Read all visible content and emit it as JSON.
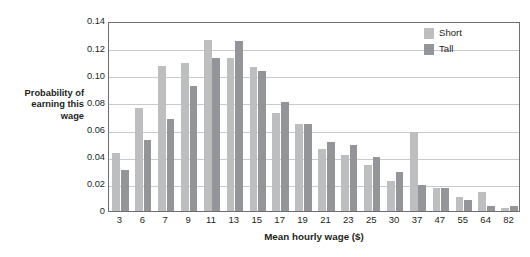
{
  "chart_data": {
    "type": "bar",
    "title": "",
    "xlabel": "Mean hourly wage ($)",
    "ylabel": "Probability of earning this wage",
    "ylabel_lines": [
      "Probability of",
      "earning this",
      "wage"
    ],
    "categories": [
      "3",
      "6",
      "7",
      "9",
      "11",
      "13",
      "15",
      "17",
      "19",
      "21",
      "23",
      "25",
      "30",
      "37",
      "47",
      "55",
      "64",
      "82"
    ],
    "series": [
      {
        "name": "Short",
        "color": "#bcbec0",
        "values": [
          0.043,
          0.076,
          0.107,
          0.109,
          0.126,
          0.113,
          0.106,
          0.072,
          0.064,
          0.046,
          0.041,
          0.034,
          0.022,
          0.058,
          0.017,
          0.01,
          0.014,
          0.002
        ]
      },
      {
        "name": "Tall",
        "color": "#939598",
        "values": [
          0.03,
          0.052,
          0.068,
          0.092,
          0.113,
          0.125,
          0.103,
          0.08,
          0.064,
          0.051,
          0.049,
          0.04,
          0.029,
          0.019,
          0.017,
          0.008,
          0.004,
          0.004
        ]
      }
    ],
    "yticks": [
      "0",
      "0.02",
      "0.04",
      "0.06",
      "0.08",
      "0.10",
      "0.12",
      "0.14"
    ],
    "ytick_values": [
      0,
      0.02,
      0.04,
      0.06,
      0.08,
      0.1,
      0.12,
      0.14
    ],
    "ylim": [
      0,
      0.14
    ],
    "grid": true,
    "legend_position": "top-right",
    "legend": [
      "Short",
      "Tall"
    ]
  },
  "legend": {
    "items": [
      {
        "label": "Short",
        "color": "#bcbec0"
      },
      {
        "label": "Tall",
        "color": "#939598"
      }
    ]
  },
  "colors": {
    "short": "#bcbec0",
    "tall": "#939598",
    "grid": "#c9cacc",
    "frame": "#6d6e71",
    "text": "#231f20"
  }
}
